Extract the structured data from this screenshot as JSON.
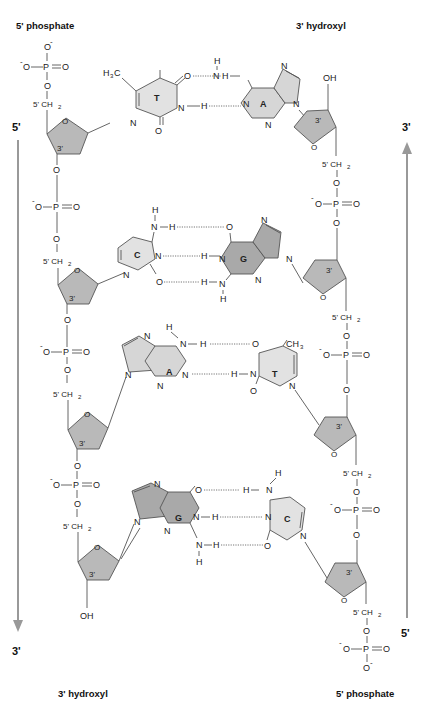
{
  "labels": {
    "top_left": "5' phosphate",
    "top_right": "3' hydroxyl",
    "bottom_left": "3' hydroxyl",
    "bottom_right": "5' phosphate"
  },
  "strand_ends": {
    "left_top": "5'",
    "left_bottom": "3'",
    "right_top": "3'",
    "right_bottom": "5'"
  },
  "strand_direction": {
    "left": "5' to 3' (downward arrow)",
    "right": "5' to 3' (upward arrow)"
  },
  "atoms": {
    "O": "O",
    "O_minus": "O",
    "minus": "-",
    "P": "P",
    "N": "N",
    "H": "H",
    "OH": "OH",
    "CH2_prefix": "5' CH",
    "sub2": "2",
    "CH3": "CH",
    "sub3": "3",
    "H3C_H": "H",
    "H3C_C": "C",
    "three_prime": "3'"
  },
  "base_pairs": [
    {
      "left": "T",
      "right": "A",
      "hydrogen_bonds": 2
    },
    {
      "left": "C",
      "right": "G",
      "hydrogen_bonds": 3
    },
    {
      "left": "A",
      "right": "T",
      "hydrogen_bonds": 2
    },
    {
      "left": "G",
      "right": "C",
      "hydrogen_bonds": 3
    }
  ],
  "base_letters": {
    "bp1_left": "T",
    "bp1_right": "A",
    "bp2_left": "C",
    "bp2_right": "G",
    "bp3_left": "A",
    "bp3_right": "T",
    "bp4_left": "G",
    "bp4_right": "C"
  },
  "colors": {
    "sugar_fill": "#b9b9b9",
    "pyrimidine_fill": "#e2e2e2",
    "purine_fill": "#d6d6d6",
    "guanine_fill": "#a9a9a9",
    "arrow": "#999999",
    "bond": "#555555"
  }
}
